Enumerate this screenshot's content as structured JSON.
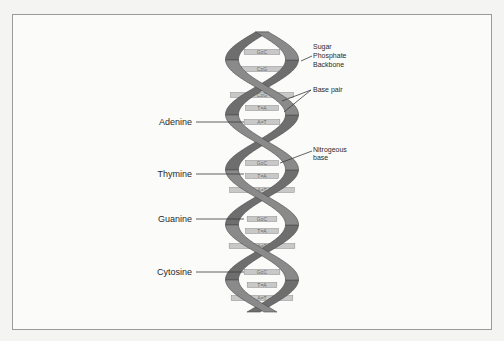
{
  "diagram": {
    "colors": {
      "strand": "#8a8a8a",
      "strand_dark": "#6e6e6e",
      "strand_edge": "#4a4a4a",
      "base_pair": "#c8c8c8",
      "leader": "#3a3a3a"
    },
    "left_labels": [
      {
        "id": "adenine",
        "text": "Adenine"
      },
      {
        "id": "thymine",
        "text": "Thymine"
      },
      {
        "id": "guanine",
        "text": "Guanine"
      },
      {
        "id": "cytosine",
        "text": "Cytosine"
      }
    ],
    "right_labels": {
      "backbone": [
        "Sugar",
        "Phosphate",
        "Backbone"
      ],
      "base_pair": "Base pair",
      "nitrogenous": [
        "Nitrogeous",
        "base"
      ]
    },
    "base_pairs": [
      "G≡C",
      "C≡G",
      "C≡G",
      "T=A",
      "A=T",
      "G≡C",
      "T=A",
      "A=T",
      "G≡C",
      "T=A",
      "A=T",
      "G≡C",
      "T=A",
      "A=T"
    ]
  }
}
